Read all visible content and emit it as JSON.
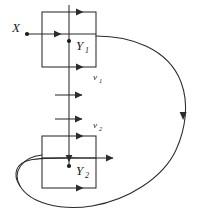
{
  "figure": {
    "type": "mathematical-flow-diagram",
    "background_color": "#ffffff",
    "stroke_color": "#2b2b2b",
    "label_color": "#1a1a1a",
    "width": 198,
    "height": 218
  },
  "labels": {
    "x_point": "X",
    "y1_base": "Y",
    "y1_sub": "1",
    "y2_base": "Y",
    "y2_sub": "2",
    "nu1_base": "ν",
    "nu1_sub": "1",
    "nu2_base": "ν",
    "nu2_sub": "2"
  },
  "boxes": [
    {
      "name": "upper-box",
      "x": 42,
      "y": 12,
      "width": 54,
      "height": 55
    },
    {
      "name": "lower-box",
      "x": 42,
      "y": 136,
      "width": 54,
      "height": 52
    }
  ],
  "points": [
    {
      "name": "x-dot",
      "cx": 27,
      "cy": 34
    },
    {
      "name": "y1-dot",
      "cx": 69,
      "cy": 41
    },
    {
      "name": "y2-dot",
      "cx": 69,
      "cy": 166
    }
  ],
  "vertical_flow": {
    "name": "vertical-transversal",
    "x": 69,
    "y_top": 5,
    "y_bottom": 166
  },
  "arrows": [
    {
      "name": "arrow-upper-box-top",
      "x": 79,
      "y": 12,
      "direction": "right"
    },
    {
      "name": "arrow-x-into-box",
      "x": 57,
      "y": 34,
      "direction": "right"
    },
    {
      "name": "arrow-upper-box-bottom",
      "x": 79,
      "y": 67,
      "direction": "right"
    },
    {
      "name": "arrow-transversal-1",
      "x": 79,
      "y": 95,
      "direction": "right"
    },
    {
      "name": "arrow-transversal-2",
      "x": 79,
      "y": 119,
      "direction": "right"
    },
    {
      "name": "arrow-lower-box-top",
      "x": 79,
      "y": 136,
      "direction": "right"
    },
    {
      "name": "arrow-lower-box-exit",
      "x": 110,
      "y": 158,
      "direction": "right"
    },
    {
      "name": "arrow-lower-box-bottom",
      "x": 79,
      "y": 188,
      "direction": "right"
    },
    {
      "name": "arrow-y2-incoming",
      "x": 69,
      "y": 162,
      "direction": "down"
    },
    {
      "name": "arrow-return-curve",
      "x": 183,
      "y": 119,
      "direction": "down"
    }
  ]
}
